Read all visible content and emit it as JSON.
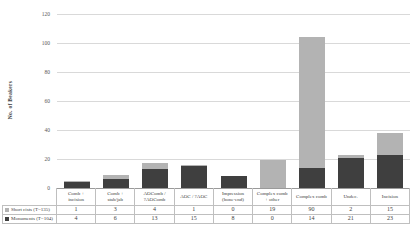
{
  "figure": {
    "ylabel": "No. of Beakers"
  },
  "chart_data": {
    "type": "bar",
    "stacked": true,
    "title": "",
    "xlabel": "",
    "ylabel": "No. of Beakers",
    "ylim": [
      0,
      120
    ],
    "yticks": [
      0,
      20,
      40,
      60,
      80,
      100,
      120
    ],
    "grid": true,
    "legend_position": "table-left",
    "categories": [
      "Comb +\nincision",
      "Comb +\nstab/jab",
      "AOComb /\n?AOComb",
      "AOC / ?AOC",
      "Impression\n(bone-end)",
      "Complex comb\n+ other",
      "Complex comb",
      "Undec.",
      "Incision"
    ],
    "series": [
      {
        "name": "Monuments (T=104)",
        "color": "#3f3f3f",
        "values": [
          4,
          6,
          13,
          15,
          8,
          0,
          14,
          21,
          23
        ]
      },
      {
        "name": "Short cists (T=135)",
        "color": "#b3b3b3",
        "values": [
          1,
          3,
          4,
          1,
          0,
          19,
          90,
          2,
          15
        ]
      }
    ],
    "table_row_order": [
      "Short cists (T=135)",
      "Monuments (T=104)"
    ]
  }
}
